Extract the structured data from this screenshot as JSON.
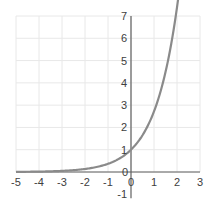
{
  "chart_data": {
    "type": "line",
    "title": "",
    "xlabel": "",
    "ylabel": "",
    "function": "y = e^x",
    "xlim": [
      -5,
      3
    ],
    "ylim": [
      -1,
      7
    ],
    "grid": true,
    "x_ticks": [
      "-5",
      "-4",
      "-3",
      "-2",
      "-1",
      "0",
      "1",
      "2",
      "3"
    ],
    "y_ticks": [
      "-1",
      "0",
      "1",
      "2",
      "3",
      "4",
      "5",
      "6",
      "7"
    ],
    "series": [
      {
        "name": "e^x",
        "color": "#808080",
        "x": [
          -5,
          -4,
          -3,
          -2,
          -1,
          0,
          1,
          1.5,
          2,
          2.5,
          2.85
        ],
        "y": [
          0.007,
          0.018,
          0.05,
          0.14,
          0.37,
          1,
          2.72,
          4.48,
          7.39,
          12.18,
          17.29
        ]
      }
    ]
  },
  "colors": {
    "axis": "#606060",
    "grid": "#e8e8e8",
    "curve": "#8a8a8a",
    "text": "#404040"
  }
}
